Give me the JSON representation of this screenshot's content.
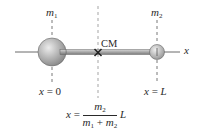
{
  "labels": {
    "mass1": "m",
    "mass1_sub": "1",
    "mass2": "m",
    "mass2_sub": "2",
    "cm": "CM",
    "axis": "x",
    "x0_var": "x",
    "x0_eq": " = 0",
    "xL_var": "x",
    "xL_eq": " = ",
    "xL_val": "L"
  },
  "formula": {
    "lhs_var": "x",
    "eq": " = ",
    "num_var": "m",
    "num_sub": "2",
    "den_var1": "m",
    "den_sub1": "1",
    "den_plus": " + ",
    "den_var2": "m",
    "den_sub2": "2",
    "tail": "L"
  },
  "colors": {
    "sphere_light": "#e8e8e8",
    "sphere_dark": "#8a8a8a",
    "rod": "#9a9a9a",
    "line": "#333333",
    "dashed": "#b5b5b5"
  }
}
